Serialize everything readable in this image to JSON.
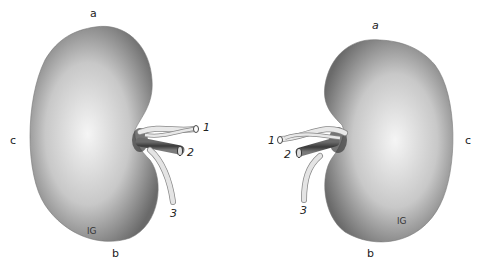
{
  "figure": {
    "left_kidney": {
      "labels": {
        "top": "a",
        "bottom": "b",
        "lateral": "c",
        "vessel_1": "1",
        "vessel_2": "2",
        "vessel_3": "3"
      }
    },
    "right_kidney": {
      "labels": {
        "top": "a",
        "bottom": "b",
        "lateral": "c",
        "vessel_1": "1",
        "vessel_2": "2",
        "vessel_3": "3"
      }
    },
    "colors": {
      "background": "#ffffff",
      "kidney_dark": "#6e6e6e",
      "kidney_light": "#f2f2f2",
      "vessel_light": "#dcdcdc",
      "vessel_dark": "#4a4a4a"
    }
  }
}
